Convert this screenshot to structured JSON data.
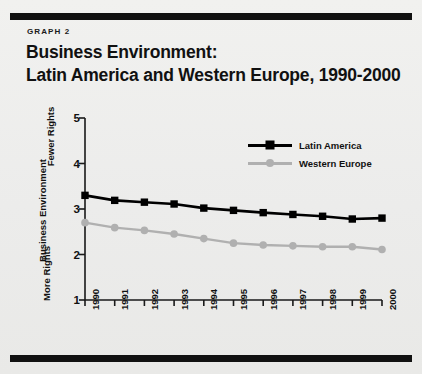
{
  "kicker": "GRAPH  2",
  "title": {
    "line1": "Business Environment:",
    "line2": "Latin America and Western Europe, 1990-2000"
  },
  "axis": {
    "y_outer_label": "Business Environment",
    "y_top_label": "Fewer Rights",
    "y_bottom_label": "More Rights"
  },
  "colors": {
    "latin_america": "#000000",
    "western_europe": "#b0b0b0",
    "rule": "#111111",
    "background": "#ececeb"
  },
  "chart_data": {
    "type": "line",
    "title": "Business Environment: Latin America and Western Europe, 1990-2000",
    "xlabel": "",
    "ylabel": "Business Environment",
    "categories": [
      "1990",
      "1991",
      "1992",
      "1993",
      "1994",
      "1995",
      "1996",
      "1997",
      "1998",
      "1999",
      "2000"
    ],
    "x": [
      1990,
      1991,
      1992,
      1993,
      1994,
      1995,
      1996,
      1997,
      1998,
      1999,
      2000
    ],
    "ylim": [
      1,
      5
    ],
    "yticks": [
      1,
      2,
      3,
      4,
      5
    ],
    "grid": false,
    "legend_position": "upper-right-inside",
    "series": [
      {
        "name": "Latin America",
        "color": "#000000",
        "marker": "square",
        "values": [
          3.3,
          3.19,
          3.15,
          3.11,
          3.02,
          2.97,
          2.92,
          2.88,
          2.84,
          2.78,
          2.8
        ]
      },
      {
        "name": "Western Europe",
        "color": "#b0b0b0",
        "marker": "circle",
        "values": [
          2.7,
          2.59,
          2.53,
          2.45,
          2.35,
          2.25,
          2.21,
          2.19,
          2.17,
          2.17,
          2.11
        ]
      }
    ]
  }
}
